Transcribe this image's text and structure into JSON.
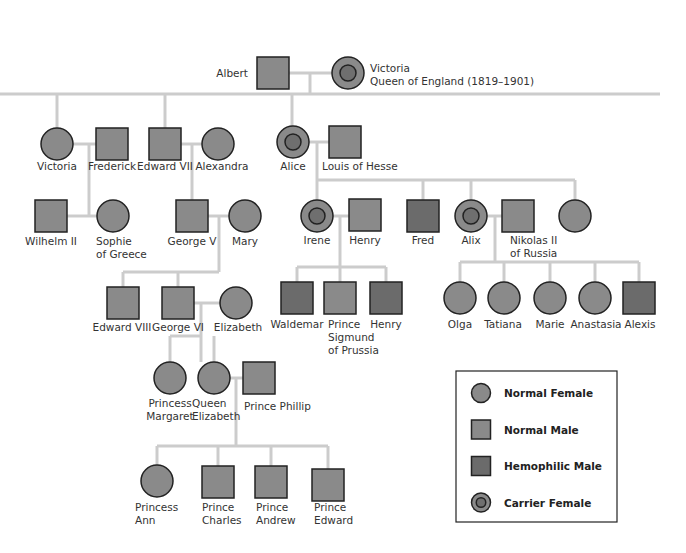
{
  "colors": {
    "normal": "#8a8a8a",
    "hemophilic": "#6b6b6b",
    "carrier_inner": "#6f6f6f",
    "line": "#cccccc",
    "stroke": "#222222"
  },
  "people": [
    {
      "id": "albert",
      "name": [
        "Albert"
      ],
      "type": "normal-male",
      "x": 273,
      "y": 73,
      "lx": 248,
      "ly": 77,
      "anchor": "end"
    },
    {
      "id": "victoria-queen",
      "name": [
        "Victoria",
        "Queen of England (1819–1901)"
      ],
      "type": "carrier-female",
      "x": 348,
      "y": 73,
      "lx": 370,
      "ly": 72,
      "anchor": "start"
    },
    {
      "id": "victoria-princess",
      "name": [
        "Victoria"
      ],
      "type": "normal-female",
      "x": 57,
      "y": 144,
      "lx": 57,
      "ly": 170,
      "anchor": "middle"
    },
    {
      "id": "frederick",
      "name": [
        "Frederick"
      ],
      "type": "normal-male",
      "x": 112,
      "y": 144,
      "lx": 112,
      "ly": 170,
      "anchor": "middle"
    },
    {
      "id": "edward-vii",
      "name": [
        "Edward VII"
      ],
      "type": "normal-male",
      "x": 165,
      "y": 144,
      "lx": 165,
      "ly": 170,
      "anchor": "middle"
    },
    {
      "id": "alexandra",
      "name": [
        "Alexandra"
      ],
      "type": "normal-female",
      "x": 218,
      "y": 144,
      "lx": 222,
      "ly": 170,
      "anchor": "middle"
    },
    {
      "id": "alice",
      "name": [
        "Alice"
      ],
      "type": "carrier-female",
      "x": 293,
      "y": 142,
      "lx": 293,
      "ly": 170,
      "anchor": "middle"
    },
    {
      "id": "louis-of-hesse",
      "name": [
        "Louis of Hesse"
      ],
      "type": "normal-male",
      "x": 345,
      "y": 142,
      "lx": 322,
      "ly": 170,
      "anchor": "start"
    },
    {
      "id": "wilhelm-ii",
      "name": [
        "Wilhelm II"
      ],
      "type": "normal-male",
      "x": 51,
      "y": 216,
      "lx": 51,
      "ly": 245,
      "anchor": "middle"
    },
    {
      "id": "sophie-of-greece",
      "name": [
        "Sophie",
        "of Greece"
      ],
      "type": "normal-female",
      "x": 113,
      "y": 216,
      "lx": 96,
      "ly": 245,
      "anchor": "start"
    },
    {
      "id": "george-v",
      "name": [
        "George V"
      ],
      "type": "normal-male",
      "x": 192,
      "y": 216,
      "lx": 192,
      "ly": 245,
      "anchor": "middle"
    },
    {
      "id": "mary",
      "name": [
        "Mary"
      ],
      "type": "normal-female",
      "x": 245,
      "y": 216,
      "lx": 245,
      "ly": 245,
      "anchor": "middle"
    },
    {
      "id": "irene",
      "name": [
        "Irene"
      ],
      "type": "carrier-female",
      "x": 317,
      "y": 216,
      "lx": 317,
      "ly": 244,
      "anchor": "middle"
    },
    {
      "id": "henry-prussia",
      "name": [
        "Henry"
      ],
      "type": "normal-male",
      "x": 365,
      "y": 215,
      "lx": 365,
      "ly": 244,
      "anchor": "middle"
    },
    {
      "id": "fred",
      "name": [
        "Fred"
      ],
      "type": "hemophilic-male",
      "x": 423,
      "y": 216,
      "lx": 423,
      "ly": 244,
      "anchor": "middle"
    },
    {
      "id": "alix",
      "name": [
        "Alix"
      ],
      "type": "carrier-female",
      "x": 471,
      "y": 216,
      "lx": 471,
      "ly": 244,
      "anchor": "middle"
    },
    {
      "id": "nikolas-ii",
      "name": [
        "Nikolas II",
        "of Russia"
      ],
      "type": "normal-male",
      "x": 518,
      "y": 216,
      "lx": 510,
      "ly": 244,
      "anchor": "start"
    },
    {
      "id": "unnamed-daughter",
      "name": [],
      "type": "normal-female",
      "x": 575,
      "y": 216,
      "lx": 575,
      "ly": 244,
      "anchor": "middle"
    },
    {
      "id": "edward-viii",
      "name": [
        "Edward VIII"
      ],
      "type": "normal-male",
      "x": 123,
      "y": 303,
      "lx": 122,
      "ly": 331,
      "anchor": "middle"
    },
    {
      "id": "george-vi",
      "name": [
        "George VI"
      ],
      "type": "normal-male",
      "x": 178,
      "y": 303,
      "lx": 178,
      "ly": 331,
      "anchor": "middle"
    },
    {
      "id": "elizabeth-bowes-lyon",
      "name": [
        "Elizabeth"
      ],
      "type": "normal-female",
      "x": 236,
      "y": 303,
      "lx": 238,
      "ly": 331,
      "anchor": "middle"
    },
    {
      "id": "waldemar",
      "name": [
        "Waldemar"
      ],
      "type": "hemophilic-male",
      "x": 297,
      "y": 298,
      "lx": 297,
      "ly": 328,
      "anchor": "middle"
    },
    {
      "id": "prince-sigmund",
      "name": [
        "Prince",
        "Sigmund",
        "of Prussia"
      ],
      "type": "normal-male",
      "x": 340,
      "y": 298,
      "lx": 328,
      "ly": 328,
      "anchor": "start"
    },
    {
      "id": "henry-hemophilic",
      "name": [
        "Henry"
      ],
      "type": "hemophilic-male",
      "x": 386,
      "y": 298,
      "lx": 386,
      "ly": 328,
      "anchor": "middle"
    },
    {
      "id": "olga",
      "name": [
        "Olga"
      ],
      "type": "normal-female",
      "x": 460,
      "y": 298,
      "lx": 460,
      "ly": 328,
      "anchor": "middle"
    },
    {
      "id": "tatiana",
      "name": [
        "Tatiana"
      ],
      "type": "normal-female",
      "x": 504,
      "y": 298,
      "lx": 503,
      "ly": 328,
      "anchor": "middle"
    },
    {
      "id": "marie",
      "name": [
        "Marie"
      ],
      "type": "normal-female",
      "x": 550,
      "y": 298,
      "lx": 550,
      "ly": 328,
      "anchor": "middle"
    },
    {
      "id": "anastasia",
      "name": [
        "Anastasia"
      ],
      "type": "normal-female",
      "x": 595,
      "y": 298,
      "lx": 596,
      "ly": 328,
      "anchor": "middle"
    },
    {
      "id": "alexis",
      "name": [
        "Alexis"
      ],
      "type": "hemophilic-male",
      "x": 639,
      "y": 298,
      "lx": 640,
      "ly": 328,
      "anchor": "middle"
    },
    {
      "id": "princess-margaret",
      "name": [
        "Princess",
        "Margaret"
      ],
      "type": "normal-female",
      "x": 170,
      "y": 378,
      "lx": 170,
      "ly": 407,
      "anchor": "middle"
    },
    {
      "id": "queen-elizabeth",
      "name": [
        "Queen",
        "Elizabeth"
      ],
      "type": "normal-female",
      "x": 214,
      "y": 378,
      "lx": 192,
      "ly": 407,
      "anchor": "start"
    },
    {
      "id": "prince-phillip",
      "name": [
        "Prince Phillip"
      ],
      "type": "normal-male",
      "x": 259,
      "y": 378,
      "lx": 244,
      "ly": 410,
      "anchor": "start"
    },
    {
      "id": "princess-ann",
      "name": [
        "Princess",
        "Ann"
      ],
      "type": "normal-female",
      "x": 157,
      "y": 481,
      "lx": 135,
      "ly": 511,
      "anchor": "start"
    },
    {
      "id": "prince-charles",
      "name": [
        "Prince",
        "Charles"
      ],
      "type": "normal-male",
      "x": 218,
      "y": 482,
      "lx": 202,
      "ly": 511,
      "anchor": "start"
    },
    {
      "id": "prince-andrew",
      "name": [
        "Prince",
        "Andrew"
      ],
      "type": "normal-male",
      "x": 271,
      "y": 482,
      "lx": 256,
      "ly": 511,
      "anchor": "start"
    },
    {
      "id": "prince-edward",
      "name": [
        "Prince",
        "Edward"
      ],
      "type": "normal-male",
      "x": 328,
      "y": 485,
      "lx": 314,
      "ly": 511,
      "anchor": "start"
    }
  ],
  "lines": [
    [
      289,
      73,
      332,
      73
    ],
    [
      310,
      73,
      310,
      94
    ],
    [
      0,
      94,
      660,
      94
    ],
    [
      57,
      94,
      57,
      128
    ],
    [
      165,
      94,
      165,
      128
    ],
    [
      292,
      94,
      292,
      126
    ],
    [
      73,
      144,
      96,
      144
    ],
    [
      89,
      144,
      89,
      216
    ],
    [
      67,
      216,
      97,
      216
    ],
    [
      181,
      144,
      202,
      144
    ],
    [
      192,
      144,
      192,
      200
    ],
    [
      309,
      142,
      329,
      142
    ],
    [
      317,
      142,
      317,
      180
    ],
    [
      317,
      180,
      575,
      180
    ],
    [
      317,
      180,
      317,
      200
    ],
    [
      423,
      180,
      423,
      200
    ],
    [
      471,
      180,
      471,
      200
    ],
    [
      575,
      180,
      575,
      200
    ],
    [
      208,
      216,
      229,
      216
    ],
    [
      219,
      216,
      219,
      272
    ],
    [
      123,
      272,
      219,
      272
    ],
    [
      123,
      272,
      123,
      287
    ],
    [
      178,
      272,
      178,
      287
    ],
    [
      333,
      216,
      349,
      216
    ],
    [
      340,
      216,
      340,
      267
    ],
    [
      297,
      267,
      386,
      267
    ],
    [
      297,
      267,
      297,
      282
    ],
    [
      340,
      267,
      340,
      282
    ],
    [
      386,
      267,
      386,
      282
    ],
    [
      487,
      216,
      502,
      216
    ],
    [
      495,
      216,
      495,
      262
    ],
    [
      460,
      262,
      639,
      262
    ],
    [
      460,
      262,
      460,
      282
    ],
    [
      504,
      262,
      504,
      282
    ],
    [
      550,
      262,
      550,
      282
    ],
    [
      595,
      262,
      595,
      282
    ],
    [
      639,
      262,
      639,
      282
    ],
    [
      194,
      303,
      220,
      303
    ],
    [
      201,
      303,
      201,
      362
    ],
    [
      170,
      336,
      201,
      336
    ],
    [
      170,
      336,
      170,
      362
    ],
    [
      214,
      336,
      214,
      362
    ],
    [
      230,
      378,
      243,
      378
    ],
    [
      236,
      378,
      236,
      446
    ],
    [
      157,
      446,
      328,
      446
    ],
    [
      157,
      446,
      157,
      465
    ],
    [
      218,
      446,
      218,
      466
    ],
    [
      271,
      446,
      271,
      466
    ],
    [
      328,
      446,
      328,
      469
    ]
  ],
  "legend": {
    "box": {
      "x": 456,
      "y": 371,
      "w": 161,
      "h": 151
    },
    "items": [
      {
        "type": "normal-female",
        "label": "Normal Female"
      },
      {
        "type": "normal-male",
        "label": "Normal Male"
      },
      {
        "type": "hemophilic-male",
        "label": "Hemophilic Male"
      },
      {
        "type": "carrier-female",
        "label": "Carrier Female"
      }
    ]
  }
}
